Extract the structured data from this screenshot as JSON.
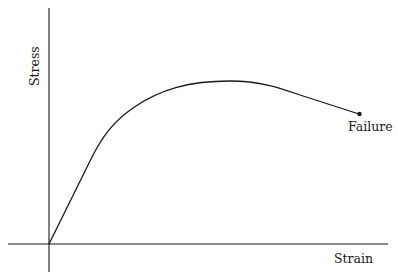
{
  "diagram": {
    "type": "stress-strain curve",
    "y_axis_label": "Stress",
    "x_axis_label": "Strain",
    "annotations": [
      {
        "label": "Failure",
        "marker": "dot at end of curve"
      }
    ],
    "curve_segments": [
      "linear elastic region from origin",
      "yielding / strain hardening to ultimate peak",
      "necking decline to failure point"
    ]
  }
}
